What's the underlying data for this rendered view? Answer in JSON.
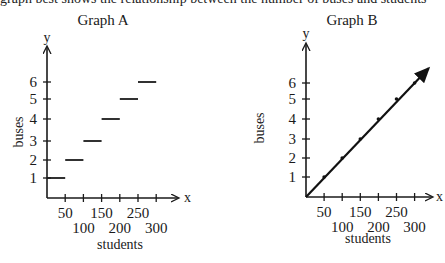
{
  "cut_text": "graph best shows the relationship between the number of buses and students",
  "chart_data": [
    {
      "type": "line",
      "subtype": "step",
      "title": "Graph A",
      "xlabel": "students",
      "ylabel": "buses",
      "x_axis_name": "x",
      "y_axis_name": "y",
      "x_ticks": [
        50,
        100,
        150,
        200,
        250,
        300
      ],
      "y_ticks": [
        1,
        2,
        3,
        4,
        5,
        6
      ],
      "xlim": [
        0,
        300
      ],
      "ylim": [
        0,
        6
      ],
      "grid": false,
      "segments": [
        {
          "x_start": 0,
          "x_end": 50,
          "y": 1
        },
        {
          "x_start": 50,
          "x_end": 100,
          "y": 2
        },
        {
          "x_start": 100,
          "x_end": 150,
          "y": 3
        },
        {
          "x_start": 150,
          "x_end": 200,
          "y": 4
        },
        {
          "x_start": 200,
          "x_end": 250,
          "y": 5
        },
        {
          "x_start": 250,
          "x_end": 300,
          "y": 6
        }
      ]
    },
    {
      "type": "line",
      "title": "Graph B",
      "xlabel": "students",
      "ylabel": "buses",
      "x_axis_name": "x",
      "y_axis_name": "y",
      "x_ticks": [
        50,
        100,
        150,
        200,
        250,
        300
      ],
      "y_ticks": [
        1,
        2,
        3,
        4,
        5,
        6
      ],
      "xlim": [
        0,
        300
      ],
      "ylim": [
        0,
        6
      ],
      "grid": false,
      "series": [
        {
          "name": "buses",
          "x": [
            0,
            50,
            100,
            150,
            200,
            250,
            300
          ],
          "values": [
            0,
            1,
            2,
            3,
            4,
            5,
            6
          ],
          "arrow_end": true,
          "points_marked": true
        }
      ]
    }
  ]
}
